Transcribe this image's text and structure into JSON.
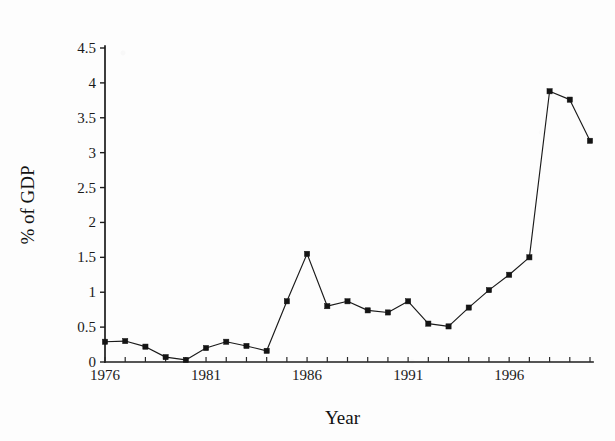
{
  "chart_data": {
    "type": "line",
    "title": "",
    "xlabel": "Year",
    "ylabel": "% of GDP",
    "x": [
      1976,
      1977,
      1978,
      1979,
      1980,
      1981,
      1982,
      1983,
      1984,
      1985,
      1986,
      1987,
      1988,
      1989,
      1990,
      1991,
      1992,
      1993,
      1994,
      1995,
      1996,
      1997,
      1998,
      1999,
      2000
    ],
    "values": [
      0.29,
      0.3,
      0.22,
      0.07,
      0.03,
      0.2,
      0.29,
      0.23,
      0.16,
      0.87,
      1.55,
      0.8,
      0.87,
      0.74,
      0.71,
      0.87,
      0.55,
      0.51,
      0.78,
      1.03,
      1.25,
      1.5,
      3.88,
      3.76,
      3.17
    ],
    "series": [
      {
        "name": "% of GDP",
        "values": [
          0.29,
          0.3,
          0.22,
          0.07,
          0.03,
          0.2,
          0.29,
          0.23,
          0.16,
          0.87,
          1.55,
          0.8,
          0.87,
          0.74,
          0.71,
          0.87,
          0.55,
          0.51,
          0.78,
          1.03,
          1.25,
          1.5,
          3.88,
          3.76,
          3.17
        ]
      }
    ],
    "xlim": [
      1976,
      2000
    ],
    "ylim": [
      0,
      4.5
    ],
    "y_ticks": [
      0,
      0.5,
      1,
      1.5,
      2,
      2.5,
      3,
      3.5,
      4,
      4.5
    ],
    "y_tick_labels": [
      "0",
      "0.5",
      "1",
      "1.5",
      "2",
      "2.5",
      "3",
      "3.5",
      "4",
      "4.5"
    ],
    "x_ticks": [
      1976,
      1977,
      1978,
      1979,
      1980,
      1981,
      1982,
      1983,
      1984,
      1985,
      1986,
      1987,
      1988,
      1989,
      1990,
      1991,
      1992,
      1993,
      1994,
      1995,
      1996,
      1997,
      1998,
      1999,
      2000
    ],
    "x_tick_labels": [
      "1976",
      "",
      "",
      "",
      "",
      "1981",
      "",
      "",
      "",
      "",
      "1986",
      "",
      "",
      "",
      "",
      "1991",
      "",
      "",
      "",
      "",
      "1996",
      "",
      "",
      "",
      ""
    ],
    "x_labeled_ticks": [
      {
        "value": 1976,
        "label": "1976"
      },
      {
        "value": 1981,
        "label": "1981"
      },
      {
        "value": 1986,
        "label": "1986"
      },
      {
        "value": 1991,
        "label": "1991"
      },
      {
        "value": 1996,
        "label": "1996"
      }
    ],
    "grid": false,
    "legend": null,
    "legend_position": "none",
    "marker": "square",
    "line_color": "#1a1a1a",
    "marker_color": "#141414",
    "background_color": "#ffffff"
  }
}
